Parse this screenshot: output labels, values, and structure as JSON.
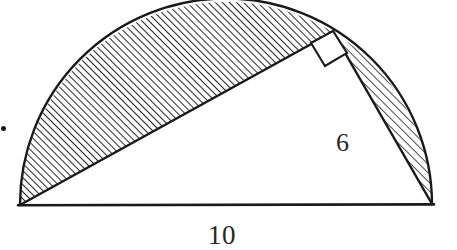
{
  "figure": {
    "background_color": "#ffffff",
    "stroke_color": "#1a1a1a",
    "hatch_color": "#2b2b2b",
    "baseline_label": "10",
    "short_leg_label": "6",
    "right_angle_marker": "right-angle-square",
    "geometry": {
      "units": "pixels",
      "left_vertex": [
        20,
        205
      ],
      "right_vertex": [
        432,
        204
      ],
      "apex_vertex": [
        333,
        32
      ],
      "circle_center": [
        226,
        204.5
      ],
      "circle_radius": 206,
      "arc_apex": [
        228,
        3
      ],
      "hatch_angle_deg": 45,
      "hatch_spacing_px": 5
    },
    "regions": [
      {
        "name": "large-shaded-segment",
        "description": "circular segment between the long leg and the arc",
        "shaded": true
      },
      {
        "name": "small-shaded-lune",
        "description": "narrow region between the short leg and the arc",
        "shaded": true
      },
      {
        "name": "triangle-interior",
        "description": "unshaded right triangle",
        "shaded": false
      }
    ],
    "measurements": [
      {
        "name": "diameter",
        "label": "10",
        "edge": "base"
      },
      {
        "name": "short-leg",
        "label": "6",
        "edge": "apex-to-right-vertex"
      }
    ]
  }
}
